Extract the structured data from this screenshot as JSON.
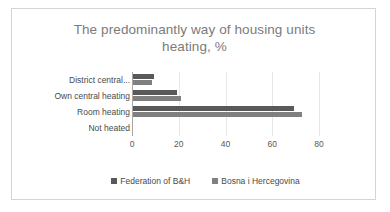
{
  "chart_data": {
    "type": "bar",
    "orientation": "horizontal",
    "title": "The predominantly way of housing units heating, %",
    "title_line1": "The predominantly way of housing units",
    "title_line2": "heating, %",
    "xlabel": "",
    "ylabel": "",
    "xlim": [
      0,
      80
    ],
    "xticks": [
      0,
      20,
      40,
      60,
      80
    ],
    "xtick_labels": [
      "0",
      "20",
      "40",
      "60",
      "80"
    ],
    "grid": true,
    "legend_position": "bottom",
    "categories": [
      "District central...",
      "Own central heating",
      "Room heating",
      "Not heated"
    ],
    "series": [
      {
        "name": "Federation of B&H",
        "color": "#595959",
        "values": [
          9,
          19,
          69,
          0
        ]
      },
      {
        "name": "Bosna i Hercegovina",
        "color": "#808080",
        "values": [
          8,
          20.5,
          72.5,
          0
        ]
      }
    ]
  },
  "colors": {
    "series_federation": "#595959",
    "series_bih": "#808080",
    "title_text": "#7b7b7b",
    "label_text": "#4a4a4a",
    "gridline": "#e6e6e6",
    "axis": "#a8a8a8",
    "frame_border": "#d4d4d4",
    "background": "#ffffff"
  }
}
